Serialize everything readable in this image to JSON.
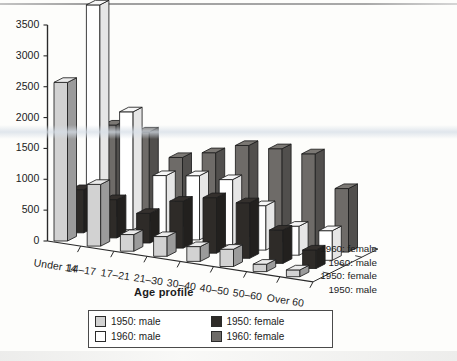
{
  "chart_data": {
    "type": "bar",
    "title": "",
    "subtitle": "",
    "xlabel": "Age profile",
    "ylabel": "",
    "zlabel": "",
    "ylim": [
      0,
      3500
    ],
    "yticks": [
      0,
      500,
      1000,
      1500,
      2000,
      2500,
      3000,
      3500
    ],
    "grid": false,
    "projection": "3d-grouped-depth",
    "legend_position": "bottom-center",
    "categories": [
      "Under 14",
      "14–17",
      "17–21",
      "21–30",
      "30–40",
      "40–50",
      "50–60",
      "Over 60"
    ],
    "depth_axis_labels": [
      "1960: female",
      "1960: male",
      "1950: female",
      "1950: male"
    ],
    "series": [
      {
        "name": "1950: male",
        "color": "#d2d2d2",
        "depth_index": 0,
        "values": [
          2570,
          1000,
          270,
          320,
          240,
          280,
          120,
          110
        ]
      },
      {
        "name": "1950: female",
        "color": "#2e2b28",
        "depth_index": 1,
        "values": [
          700,
          620,
          480,
          760,
          900,
          900,
          540,
          300
        ]
      },
      {
        "name": "1960: male",
        "color": "#ffffff",
        "depth_index": 2,
        "values": [
          3560,
          1910,
          960,
          1040,
          1060,
          720,
          470,
          480
        ]
      },
      {
        "name": "1960: female",
        "color": "#6e6b68",
        "depth_index": 3,
        "values": [
          1480,
          1450,
          1120,
          1280,
          1480,
          1510,
          1510,
          1030
        ]
      }
    ]
  },
  "legend": {
    "items": [
      {
        "label": "1950: male",
        "swatch": "#d2d2d2"
      },
      {
        "label": "1950: female",
        "swatch": "#2e2b28"
      },
      {
        "label": "1960: male",
        "swatch": "#ffffff"
      },
      {
        "label": "1960: female",
        "swatch": "#6e6b68"
      }
    ]
  }
}
